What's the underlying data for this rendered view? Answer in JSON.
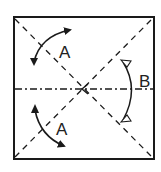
{
  "diagram": {
    "type": "origami-fold-instruction",
    "colors": {
      "background": "#ffffff",
      "line": "#1a1a1a"
    },
    "square": {
      "x": 14,
      "y": 17,
      "width": 140,
      "height": 142
    },
    "center": {
      "x": 82,
      "y": 89
    },
    "fold_lines": [
      {
        "name": "diagonal-top-left-to-bottom-right",
        "style": "dashed"
      },
      {
        "name": "diagonal-bottom-left-to-top-right",
        "style": "dashed"
      },
      {
        "name": "horizontal-midline",
        "style": "dash-dot",
        "arrow_at": "center"
      }
    ],
    "arrows": [
      {
        "name": "fold-arrow-top-left",
        "label": "A"
      },
      {
        "name": "fold-arrow-bottom-left",
        "label": "A"
      },
      {
        "name": "fold-arrow-right",
        "label": "B",
        "arrowheads": "hollow-both-ends"
      }
    ],
    "labels": {
      "top_left": "A",
      "bottom_left": "A",
      "right": "B"
    }
  }
}
